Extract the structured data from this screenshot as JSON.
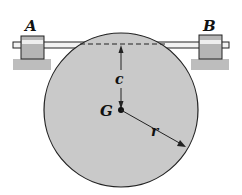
{
  "diagram": {
    "labels": {
      "bearing_left": "A",
      "bearing_right": "B",
      "offset": "c",
      "center_of_mass": "G",
      "radius": "r"
    },
    "colors": {
      "disk_fill": "#c9c9c9",
      "bearing_fill": "#b5b5b5",
      "base_fill": "#bdbdbd",
      "line": "#222222"
    }
  }
}
